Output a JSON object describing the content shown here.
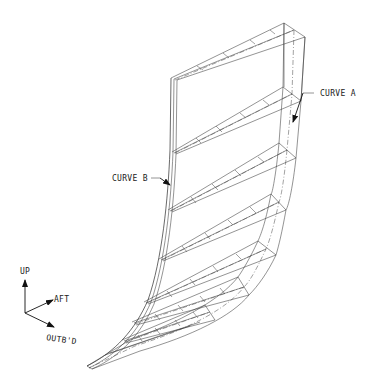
{
  "diagram": {
    "type": "isometric-wireframe",
    "labels": {
      "curve_a": "CURVE A",
      "curve_b": "CURVE B"
    },
    "axes": {
      "up": "UP",
      "aft": "AFT",
      "outboard": "OUTB'D"
    },
    "rib_count": 7,
    "line_color": "#3a3a3a",
    "background": "#ffffff"
  }
}
